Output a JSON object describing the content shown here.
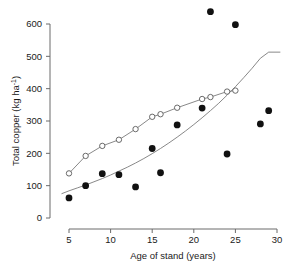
{
  "chart_data": {
    "type": "scatter",
    "title": "",
    "xlabel": "Age of stand (years)",
    "ylabel": "Total copper (kg ha-1)",
    "ylabel_display": "Total copper (kg ha⁻¹)",
    "xlim": [
      4.0,
      30.5
    ],
    "ylim": [
      0,
      660
    ],
    "xticks": [
      5,
      10,
      15,
      20,
      25,
      30
    ],
    "xtick_labels": [
      "5",
      "10",
      "15",
      "20",
      "25",
      "30"
    ],
    "yticks": [
      0,
      100,
      200,
      300,
      400,
      500,
      600
    ],
    "ytick_labels": [
      "0",
      "100",
      "200",
      "300",
      "400",
      "500",
      "600"
    ],
    "grid": false,
    "legend": "none",
    "axis_style": "left-and-bottom-spines",
    "colors": {
      "axis": "#6b6b6b",
      "text": "#1a1a1a",
      "filled_marker": "#111111",
      "open_marker_edge": "#5a5a5a",
      "open_marker_fill": "#ffffff",
      "connecting_line": "#7a7a7a",
      "fitted_curve": "#7a7a7a",
      "background": "#ffffff"
    },
    "series": [
      {
        "name": "open-circles",
        "marker": "open-circle",
        "connected": true,
        "x": [
          5,
          7,
          9,
          11,
          13,
          15,
          16,
          18,
          21,
          22,
          24,
          25
        ],
        "y": [
          138,
          192,
          223,
          242,
          275,
          313,
          321,
          341,
          368,
          374,
          391,
          394
        ]
      },
      {
        "name": "filled-circles",
        "marker": "filled-circle",
        "connected": false,
        "x": [
          5,
          7,
          9,
          11,
          13,
          15,
          16,
          18,
          21,
          22,
          24,
          25,
          28,
          29
        ],
        "y": [
          62,
          100,
          137,
          134,
          96,
          215,
          140,
          288,
          340,
          638,
          198,
          598,
          291,
          332
        ]
      }
    ],
    "fitted_curve": {
      "name": "fitted-exponential-curve",
      "x": [
        4.1,
        5,
        6,
        7,
        8,
        9,
        10,
        11,
        12,
        13,
        14,
        15,
        16,
        17,
        18,
        19,
        20,
        21,
        22,
        23,
        24,
        25,
        26,
        27,
        28,
        29,
        30,
        30.4
      ],
      "y": [
        75,
        84,
        93,
        102,
        112,
        122,
        133,
        145,
        157,
        170,
        184,
        199,
        215,
        232,
        250,
        269,
        289,
        310,
        332,
        355,
        380,
        406,
        434,
        463,
        494,
        513,
        513,
        513
      ]
    }
  }
}
